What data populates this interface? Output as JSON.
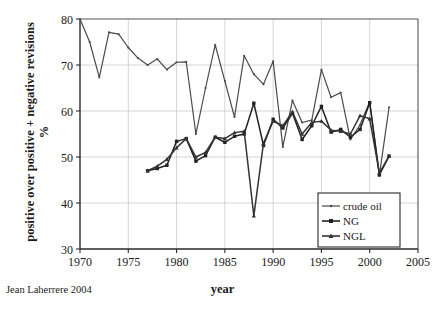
{
  "chart_data": {
    "type": "line",
    "title": "",
    "xlabel": "year",
    "ylabel": "positive over positive + negative revisions %",
    "xlim": [
      1970,
      2005
    ],
    "ylim": [
      30,
      80
    ],
    "xticks": [
      "1970",
      "1975",
      "1980",
      "1985",
      "1990",
      "1995",
      "2000",
      "2005"
    ],
    "yticks": [
      "30",
      "40",
      "50",
      "60",
      "70",
      "80"
    ],
    "grid": true,
    "legend_position": "bottom-right",
    "series": [
      {
        "name": "crude oil",
        "color": "#4a4a4a",
        "x": [
          1970,
          1971,
          1972,
          1973,
          1974,
          1975,
          1976,
          1977,
          1978,
          1979,
          1980,
          1981,
          1982,
          1983,
          1984,
          1985,
          1986,
          1987,
          1988,
          1989,
          1990,
          1991,
          1992,
          1993,
          1994,
          1995,
          1996,
          1997,
          1998,
          1999,
          2000,
          2001,
          2002
        ],
        "values": [
          80.0,
          75.0,
          67.3,
          77.1,
          76.7,
          73.8,
          71.5,
          70.0,
          71.3,
          69.0,
          70.6,
          70.7,
          55.0,
          65.0,
          74.4,
          66.5,
          58.7,
          72.0,
          68.0,
          65.8,
          70.8,
          52.2,
          62.3,
          57.5,
          58.0,
          69.0,
          63.0,
          64.0,
          53.8,
          57.0,
          62.0,
          46.0,
          60.8
        ]
      },
      {
        "name": "NG",
        "color": "#222222",
        "x": [
          1977,
          1978,
          1979,
          1980,
          1981,
          1982,
          1983,
          1984,
          1985,
          1986,
          1987,
          1988,
          1989,
          1990,
          1991,
          1992,
          1993,
          1994,
          1995,
          1996,
          1997,
          1998,
          1999,
          2000,
          2001,
          2002
        ],
        "values": [
          47.0,
          47.5,
          48.2,
          53.4,
          54.0,
          49.1,
          50.3,
          54.3,
          53.2,
          54.5,
          55.0,
          61.7,
          52.5,
          58.2,
          56.3,
          59.5,
          53.8,
          56.8,
          61.0,
          55.4,
          56.0,
          54.3,
          56.0,
          61.8,
          46.1,
          50.2
        ]
      },
      {
        "name": "NGL",
        "color": "#333333",
        "x": [
          1977,
          1978,
          1979,
          1980,
          1981,
          1982,
          1983,
          1984,
          1985,
          1986,
          1987,
          1988,
          1989,
          1990,
          1991,
          1992,
          1993,
          1994,
          1995,
          1996,
          1997,
          1998,
          1999,
          2000,
          2001,
          2002
        ],
        "values": [
          47.0,
          48.0,
          49.5,
          52.0,
          54.0,
          50.0,
          51.0,
          54.3,
          54.0,
          55.3,
          55.6,
          37.2,
          53.0,
          57.8,
          56.8,
          59.8,
          55.0,
          57.5,
          57.8,
          55.8,
          55.6,
          55.0,
          59.0,
          58.3,
          46.5,
          50.2
        ]
      }
    ]
  },
  "credit": "Jean Laherrere 2004",
  "legend": {
    "items": [
      {
        "label": "crude oil"
      },
      {
        "label": "NG"
      },
      {
        "label": "NGL"
      }
    ]
  }
}
